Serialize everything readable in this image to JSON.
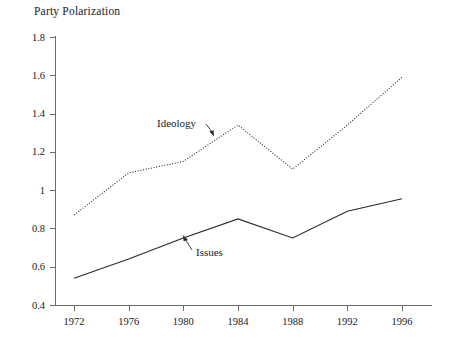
{
  "chart_data": {
    "type": "line",
    "title": "Party Polarization",
    "xlabel": "",
    "ylabel": "",
    "x": [
      1972,
      1976,
      1980,
      1984,
      1988,
      1992,
      1996
    ],
    "xticklabels": [
      "1972",
      "1976",
      "1980",
      "1984",
      "1988",
      "1992",
      "1996"
    ],
    "yticks": [
      0.4,
      0.6,
      0.8,
      1.0,
      1.2,
      1.4,
      1.6,
      1.8
    ],
    "yticklabels": [
      "0.4",
      "0.6",
      "0.8",
      "1",
      "1.2",
      "1.4",
      "1.6",
      "1.8"
    ],
    "xlim": [
      1972,
      1996
    ],
    "ylim": [
      0.4,
      1.8
    ],
    "grid": false,
    "legend": "inline-annotations",
    "series": [
      {
        "name": "Ideology",
        "style": "dotted",
        "color": "#2a2a2a",
        "values": [
          0.87,
          1.09,
          1.15,
          1.34,
          1.11,
          1.34,
          1.59
        ]
      },
      {
        "name": "Issues",
        "style": "solid",
        "color": "#2a2a2a",
        "values": [
          0.54,
          0.64,
          0.75,
          0.85,
          0.75,
          0.89,
          0.955
        ]
      }
    ],
    "annotations": [
      {
        "text": "Ideology",
        "points_to_series": "Ideology",
        "arrow": "down-right"
      },
      {
        "text": "Issues",
        "points_to_series": "Issues",
        "arrow": "up-left"
      }
    ]
  },
  "labels": {
    "ideology": "Ideology",
    "issues": "Issues"
  }
}
